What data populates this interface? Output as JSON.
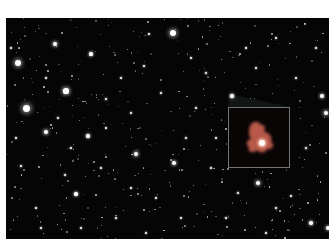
{
  "image": {
    "description": "Deep-field astronomical image of a dense star/galaxy field with a magnified inset of a reddish distant galaxy",
    "background_color": "#050505",
    "inset": {
      "label": "magnified galaxy inset",
      "frame_color": "#6f7570",
      "galaxy_color": "#c0604f",
      "core_color": "#fff2e8"
    }
  },
  "stars": [
    [
      12,
      45,
      3
    ],
    [
      49,
      26,
      2.2
    ],
    [
      60,
      73,
      2.6
    ],
    [
      20,
      90,
      3.5
    ],
    [
      85,
      36,
      1.6
    ],
    [
      100,
      81,
      1.4
    ],
    [
      138,
      48,
      1.4
    ],
    [
      167,
      15,
      3
    ],
    [
      143,
      16,
      1.3
    ],
    [
      40,
      114,
      2.2
    ],
    [
      82,
      118,
      1.6
    ],
    [
      130,
      136,
      2.2
    ],
    [
      168,
      145,
      2
    ],
    [
      252,
      165,
      2.2
    ],
    [
      320,
      95,
      2.4
    ],
    [
      316,
      78,
      1.8
    ],
    [
      15,
      148,
      1.3
    ],
    [
      70,
      176,
      1.6
    ],
    [
      110,
      200,
      1.3
    ],
    [
      190,
      90,
      1.2
    ],
    [
      200,
      55,
      1.4
    ],
    [
      226,
      78,
      1.6
    ],
    [
      290,
      60,
      1.3
    ],
    [
      300,
      130,
      1.3
    ],
    [
      305,
      205,
      1.8
    ],
    [
      322,
      210,
      2
    ],
    [
      52,
      100,
      1.2
    ],
    [
      59,
      157,
      1.2
    ],
    [
      125,
      95,
      1.1
    ],
    [
      150,
      180,
      1.2
    ],
    [
      220,
      200,
      1.2
    ],
    [
      270,
      190,
      1.3
    ],
    [
      180,
      120,
      1.2
    ],
    [
      95,
      150,
      1.1
    ],
    [
      30,
      190,
      1.2
    ],
    [
      10,
      120,
      1.2
    ],
    [
      240,
      30,
      1.2
    ],
    [
      270,
      20,
      1.1
    ],
    [
      310,
      30,
      1.2
    ],
    [
      40,
      60,
      1.1
    ],
    [
      115,
      60,
      1.2
    ],
    [
      155,
      75,
      1.1
    ],
    [
      205,
      150,
      1.1
    ],
    [
      175,
      200,
      1.1
    ],
    [
      260,
      215,
      1.1
    ],
    [
      75,
      210,
      1.1
    ],
    [
      35,
      210,
      1.1
    ],
    [
      140,
      215,
      1.1
    ],
    [
      5,
      30,
      1.1
    ],
    [
      285,
      178,
      1.2
    ],
    [
      232,
      175,
      1.2
    ],
    [
      210,
      120,
      1.1
    ],
    [
      185,
      40,
      1.1
    ],
    [
      250,
      50,
      1.1
    ],
    [
      125,
      170,
      1.1
    ],
    [
      65,
      130,
      1.1
    ],
    [
      100,
      110,
      1.1
    ]
  ]
}
